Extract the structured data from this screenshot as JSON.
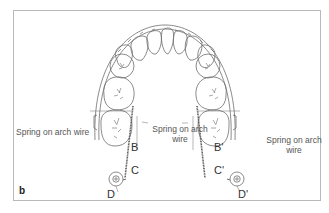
{
  "figure": {
    "panel_label": "b",
    "labels": {
      "left_spring": "Spring on arch wire",
      "center_spring_line1": "Spring on arch",
      "center_spring_line2": "wire",
      "right_spring_line1": "Spring on arch",
      "right_spring_line2": "wire"
    },
    "points": {
      "B": "B",
      "C": "C",
      "D": "D",
      "B_prime": "B'",
      "C_prime": "C'",
      "D_prime": "D'"
    },
    "colors": {
      "line": "#6a6a6a",
      "frame": "#b9b9b9",
      "text": "#555555"
    }
  }
}
